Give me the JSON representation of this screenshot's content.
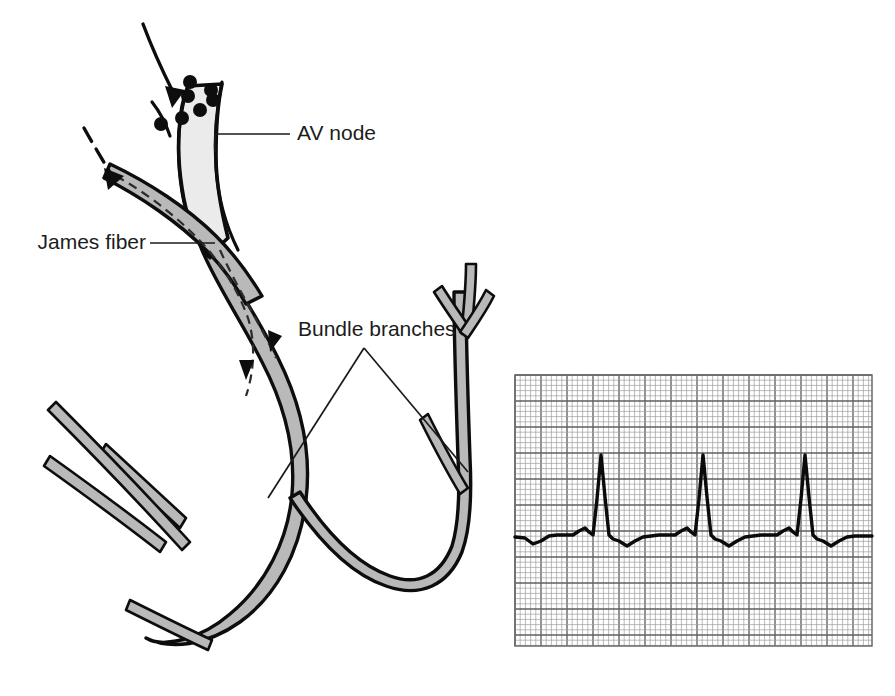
{
  "figure": {
    "kind": "medical-illustration",
    "background_color": "#ffffff",
    "ink_color": "#0d0d0d",
    "tract_fill_color": "#b9b9b9",
    "node_fill_color": "#ebebeb"
  },
  "labels": {
    "av_node": "AV node",
    "james_fiber": "James fiber",
    "bundle_branches": "Bundle branches"
  },
  "annotations": {
    "impulse_arrow_solid": "solid-arrow-into-av-node",
    "impulse_arrow_dashed": "dashed-arrow-into-james-fiber",
    "atrial_dots_count": 7,
    "internal_dashed_path": "james-fiber-bypass-tract"
  },
  "ecg": {
    "title": "",
    "paper_color": "#ffffff",
    "minor_grid_color": "#9d9d9d",
    "major_grid_color": "#5f5f5f",
    "trace_color": "#0b0b0b",
    "x": 515,
    "y": 375,
    "width": 357,
    "height": 271,
    "small_box_px": 5.2,
    "boxes_per_major": 5,
    "beats": 3,
    "features": [
      "short PR interval",
      "delta-like P-R fusion",
      "tall narrow R",
      "inverted T wave"
    ]
  },
  "chart_data": {
    "type": "line",
    "xlabel": "",
    "ylabel": "",
    "grid": true,
    "legend": "none",
    "xlim": [
      0,
      357
    ],
    "ylim": [
      -90,
      30
    ],
    "baseline_y_px": 537,
    "r_peak_x_px": [
      590,
      690,
      792
    ],
    "r_peak_top_y_px": 455,
    "r_amplitude_px": 82,
    "beat_interval_px": 101,
    "series": [
      {
        "name": "lead-II",
        "x": [
          0,
          10,
          18,
          26,
          34,
          42,
          50,
          58,
          64,
          70,
          74,
          78,
          82,
          86,
          90,
          94,
          98,
          104,
          112,
          120,
          128,
          136,
          144,
          152,
          160,
          166,
          172,
          176,
          180,
          184,
          188,
          192,
          196,
          200,
          206,
          214,
          222,
          230,
          238,
          246,
          254,
          262,
          268,
          274,
          278,
          282,
          286,
          290,
          294,
          298,
          302,
          308,
          316,
          324,
          332,
          340,
          348,
          357
        ],
        "y": [
          0,
          -1,
          -7,
          -4,
          1,
          2,
          2,
          2,
          6,
          9,
          5,
          2,
          38,
          82,
          40,
          2,
          -2,
          -4,
          -9,
          -4,
          0,
          1,
          2,
          2,
          2,
          6,
          9,
          5,
          2,
          38,
          82,
          40,
          2,
          -2,
          -4,
          -9,
          -4,
          0,
          1,
          2,
          2,
          2,
          6,
          9,
          5,
          2,
          38,
          82,
          40,
          2,
          -2,
          -4,
          -9,
          -4,
          0,
          1,
          1,
          1
        ]
      }
    ]
  }
}
